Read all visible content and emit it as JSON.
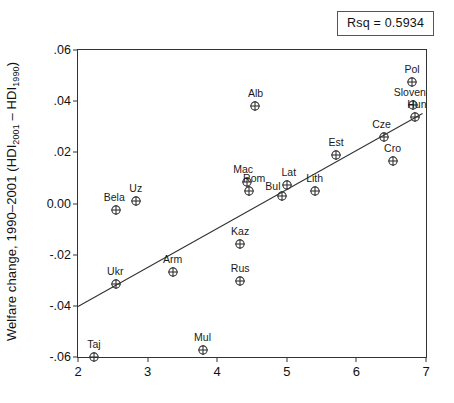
{
  "annotation": {
    "rsq_label": "Rsq = 0.5934"
  },
  "axes": {
    "ylabel_prefix": "Welfare change, 1990–2001 (HDI",
    "ylabel_sub1": "2001",
    "ylabel_mid": " – HDI",
    "ylabel_sub2": "1990",
    "ylabel_suffix": ")",
    "xlabel": ""
  },
  "chart_data": {
    "type": "scatter",
    "title": "",
    "xlabel": "",
    "ylabel": "Welfare change, 1990–2001 (HDI2001 – HDI1990)",
    "xlim": [
      2,
      7
    ],
    "ylim": [
      -0.06,
      0.06
    ],
    "xticks": [
      "2",
      "3",
      "4",
      "5",
      "6",
      "7"
    ],
    "xtick_values": [
      2,
      3,
      4,
      5,
      6,
      7
    ],
    "yticks": [
      ".06",
      ".04",
      ".02",
      "0.00",
      "-.02",
      "-.04",
      "-.06"
    ],
    "ytick_values": [
      0.06,
      0.04,
      0.02,
      0.0,
      -0.02,
      -0.04,
      -0.06
    ],
    "grid": false,
    "legend": false,
    "marker": "crossed-circle",
    "rsq": 0.5934,
    "fit_line": {
      "type": "linear",
      "x_start": 2.0,
      "y_start": -0.0403,
      "x_end": 6.95,
      "y_end": 0.0352
    },
    "points": [
      {
        "label": "Taj",
        "x": 2.23,
        "y": -0.06,
        "label_dx": 0,
        "label_dy": -8
      },
      {
        "label": "Bela",
        "x": 2.55,
        "y": -0.0025,
        "label_dx": -2,
        "label_dy": -8
      },
      {
        "label": "Ukr",
        "x": 2.55,
        "y": -0.0313,
        "label_dx": -1,
        "label_dy": -8
      },
      {
        "label": "Uz",
        "x": 2.83,
        "y": 0.0008,
        "label_dx": 0,
        "label_dy": -8
      },
      {
        "label": "Arm",
        "x": 3.36,
        "y": -0.0268,
        "label_dx": 0,
        "label_dy": -8
      },
      {
        "label": "Mul",
        "x": 3.79,
        "y": -0.0573,
        "label_dx": 0,
        "label_dy": -8
      },
      {
        "label": "Kaz",
        "x": 4.33,
        "y": -0.0158,
        "label_dx": 0,
        "label_dy": -8
      },
      {
        "label": "Rus",
        "x": 4.33,
        "y": -0.0303,
        "label_dx": 0,
        "label_dy": -8
      },
      {
        "label": "Mac",
        "x": 4.43,
        "y": 0.0085,
        "label_dx": -4,
        "label_dy": -8
      },
      {
        "label": "Rom",
        "x": 4.46,
        "y": 0.005,
        "label_dx": 5,
        "label_dy": -8
      },
      {
        "label": "Alb",
        "x": 4.55,
        "y": 0.0383,
        "label_dx": 0,
        "label_dy": -8
      },
      {
        "label": "Bul",
        "x": 4.93,
        "y": 0.0028,
        "label_dx": -9,
        "label_dy": -5
      },
      {
        "label": "Lat",
        "x": 5.0,
        "y": 0.0073,
        "label_dx": 2,
        "label_dy": -8
      },
      {
        "label": "Lith",
        "x": 5.4,
        "y": 0.0048,
        "label_dx": 0,
        "label_dy": -8
      },
      {
        "label": "Est",
        "x": 5.71,
        "y": 0.0191,
        "label_dx": 0,
        "label_dy": -8
      },
      {
        "label": "Cze",
        "x": 6.39,
        "y": 0.0259,
        "label_dx": -2,
        "label_dy": -8
      },
      {
        "label": "Cro",
        "x": 6.52,
        "y": 0.0167,
        "label_dx": 0,
        "label_dy": -8
      },
      {
        "label": "Pol",
        "x": 6.8,
        "y": 0.0474,
        "label_dx": 0,
        "label_dy": -8
      },
      {
        "label": "Sloven",
        "x": 6.81,
        "y": 0.0385,
        "label_dx": -3,
        "label_dy": -8
      },
      {
        "label": "Hun",
        "x": 6.84,
        "y": 0.034,
        "label_dx": 2,
        "label_dy": -8
      }
    ]
  }
}
